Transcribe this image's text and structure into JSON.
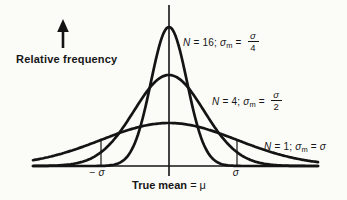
{
  "figure": {
    "y_axis_label": "Relative frequency",
    "x_axis_label": "True mean",
    "x_axis_value": " = μ",
    "neg_sigma_tick": "− σ",
    "pos_sigma_tick": "σ"
  },
  "curve_labels": [
    {
      "n": "N",
      "eq1": " = 16; ",
      "sigma": "σ",
      "sub": "m",
      "eq2": " = ",
      "num": "σ",
      "den": "4"
    },
    {
      "n": "N",
      "eq1": " = 4; ",
      "sigma": "σ",
      "sub": "m",
      "eq2": " = ",
      "num": "σ",
      "den": "2"
    },
    {
      "n": "N",
      "eq1": " = 1; ",
      "sigma": "σ",
      "sub": "m",
      "eq2": " = ",
      "plain": "σ"
    }
  ],
  "chart_data": {
    "type": "line",
    "title": "",
    "xlabel": "True mean = μ",
    "ylabel": "Relative frequency",
    "x_ticks": [
      "− σ",
      "σ"
    ],
    "grid": false,
    "legend_position": "inline-annotations",
    "series": [
      {
        "name": "N = 16; σm = σ/4",
        "N": 16,
        "sigma_of_mean": "σ/4",
        "shape": "gaussian",
        "relative_peak": 3.23,
        "relative_width": 0.25
      },
      {
        "name": "N = 4; σm = σ/2",
        "N": 4,
        "sigma_of_mean": "σ/2",
        "shape": "gaussian",
        "relative_peak": 2.12,
        "relative_width": 0.5
      },
      {
        "name": "N = 1; σm = σ",
        "N": 1,
        "sigma_of_mean": "σ",
        "shape": "gaussian",
        "relative_peak": 1.0,
        "relative_width": 1.0
      }
    ],
    "annotations": [
      "vertical marker lines at x = −σ and x = +σ up to the N = 1 curve",
      "center line at true mean μ"
    ],
    "geometry": {
      "center_x": 169,
      "baseline_y": 166,
      "sigma_px": 68,
      "axis_x": [
        33,
        318
      ],
      "axis_top_y": 5,
      "axis_tick_bottom_y": 176,
      "peak_px": [
        139,
        91,
        43
      ],
      "sigma_widths_px": [
        18,
        35,
        68
      ]
    }
  }
}
